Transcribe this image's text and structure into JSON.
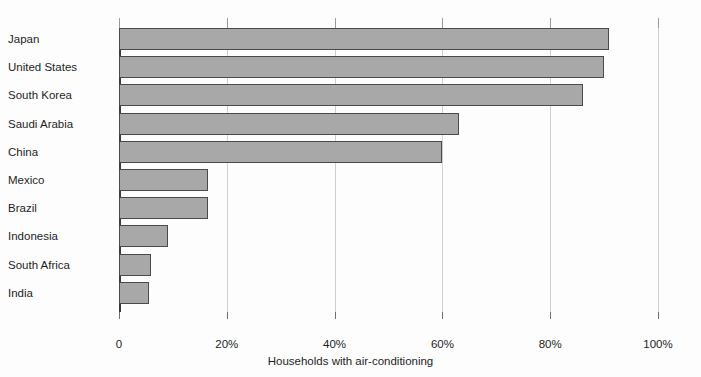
{
  "chart_data": {
    "type": "bar",
    "orientation": "horizontal",
    "title": "",
    "xlabel": "Households with air-conditioning",
    "ylabel": "",
    "xlim": [
      0,
      100
    ],
    "xticks": [
      0,
      20,
      40,
      60,
      80,
      100
    ],
    "xtick_labels": [
      "0",
      "20%",
      "40%",
      "60%",
      "80%",
      "100%"
    ],
    "grid": "vertical",
    "legend": "none",
    "units": "percent",
    "categories": [
      "Japan",
      "United States",
      "South Korea",
      "Saudi Arabia",
      "China",
      "Mexico",
      "Brazil",
      "Indonesia",
      "South Africa",
      "India"
    ],
    "values": [
      91,
      90,
      86,
      63,
      60,
      16.5,
      16.5,
      9,
      6,
      5.5
    ],
    "series": [
      {
        "name": "Households with air-conditioning",
        "values": [
          91,
          90,
          86,
          63,
          60,
          16.5,
          16.5,
          9,
          6,
          5.5
        ]
      }
    ]
  },
  "style": {
    "bar_fill": "#a8a8a8",
    "bar_stroke": "#4a4a4a",
    "gridline_color": "#cfcfcf",
    "axis_color": "#3a3a3a",
    "text_color": "#1d1d1d",
    "background": "#fdfdfd"
  }
}
